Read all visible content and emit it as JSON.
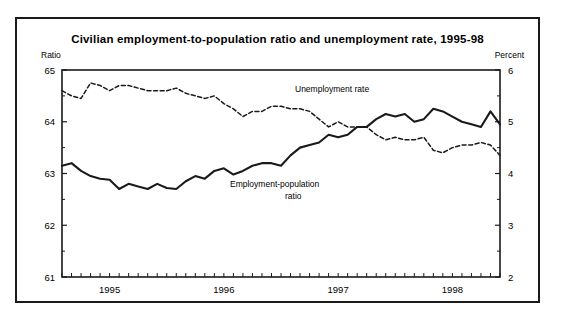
{
  "figure": {
    "title": "Civilian employment-to-population ratio and unemployment rate, 1995-98",
    "left_axis_label": "Ratio",
    "right_axis_label": "Percent"
  },
  "annotations": {
    "unemployment": "Unemployment rate",
    "employment_line1": "Employment-population",
    "employment_line2": "ratio"
  },
  "chart_data": {
    "type": "line",
    "title": "Civilian employment-to-population ratio and unemployment rate, 1995-98",
    "xlabel": "",
    "ylabel": "Ratio",
    "y2label": "Percent",
    "ylim": [
      61,
      65
    ],
    "y2lim": [
      2,
      6
    ],
    "yticks": [
      61,
      62,
      63,
      64,
      65
    ],
    "y2ticks": [
      2,
      3,
      4,
      5,
      6
    ],
    "grid": false,
    "legend": "inline-annotations",
    "xlim": [
      "1995-01",
      "1998-11"
    ],
    "xtick_labels": [
      "1995",
      "1996",
      "1997",
      "1998"
    ],
    "xtick_positions": [
      "1995-06",
      "1996-06",
      "1997-06",
      "1998-06"
    ],
    "minor_xticks": "monthly",
    "x": [
      "1995-01",
      "1995-02",
      "1995-03",
      "1995-04",
      "1995-05",
      "1995-06",
      "1995-07",
      "1995-08",
      "1995-09",
      "1995-10",
      "1995-11",
      "1995-12",
      "1996-01",
      "1996-02",
      "1996-03",
      "1996-04",
      "1996-05",
      "1996-06",
      "1996-07",
      "1996-08",
      "1996-09",
      "1996-10",
      "1996-11",
      "1996-12",
      "1997-01",
      "1997-02",
      "1997-03",
      "1997-04",
      "1997-05",
      "1997-06",
      "1997-07",
      "1997-08",
      "1997-09",
      "1997-10",
      "1997-11",
      "1997-12",
      "1998-01",
      "1998-02",
      "1998-03",
      "1998-04",
      "1998-05",
      "1998-06",
      "1998-07",
      "1998-08",
      "1998-09",
      "1998-10",
      "1998-11"
    ],
    "series": [
      {
        "name": "Employment-population ratio",
        "axis": "left",
        "style": "solid",
        "unit": "ratio",
        "values": [
          63.15,
          63.2,
          63.05,
          62.95,
          62.9,
          62.88,
          62.7,
          62.8,
          62.75,
          62.7,
          62.8,
          62.72,
          62.7,
          62.85,
          62.95,
          62.9,
          63.05,
          63.1,
          62.98,
          63.05,
          63.15,
          63.2,
          63.2,
          63.15,
          63.35,
          63.5,
          63.55,
          63.6,
          63.75,
          63.7,
          63.75,
          63.9,
          63.9,
          64.05,
          64.15,
          64.1,
          64.15,
          64.0,
          64.05,
          64.25,
          64.2,
          64.1,
          64.0,
          63.95,
          63.9,
          64.2,
          63.95
        ]
      },
      {
        "name": "Unemployment rate",
        "axis": "right",
        "style": "dashed",
        "unit": "percent",
        "values": [
          5.6,
          5.5,
          5.45,
          5.75,
          5.7,
          5.6,
          5.7,
          5.7,
          5.65,
          5.6,
          5.6,
          5.6,
          5.65,
          5.55,
          5.5,
          5.45,
          5.5,
          5.35,
          5.25,
          5.1,
          5.2,
          5.2,
          5.3,
          5.3,
          5.25,
          5.25,
          5.2,
          5.05,
          4.9,
          5.0,
          4.9,
          4.9,
          4.9,
          4.75,
          4.65,
          4.7,
          4.65,
          4.65,
          4.7,
          4.45,
          4.4,
          4.5,
          4.55,
          4.55,
          4.6,
          4.55,
          4.35
        ]
      }
    ]
  }
}
